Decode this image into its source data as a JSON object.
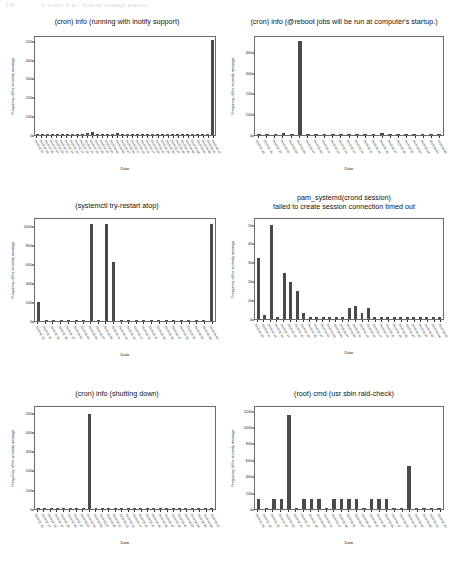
{
  "header": {
    "page_number": "146",
    "running_title": "A. Author et al. / Anomaly message analysis"
  },
  "common": {
    "ylabel": "Frequency of the anomaly message",
    "xlabel": "Date"
  },
  "chart_data": [
    {
      "id": "cron-inotify",
      "type": "bar",
      "title": "(cron) info (running with inotify support)",
      "xlabel": "Date",
      "ylabel": "Frequency of the anomaly message",
      "ylim": [
        0,
        530
      ],
      "yticks": [
        0,
        100,
        200,
        300,
        400,
        500
      ],
      "grid": false,
      "categories": [
        "2019-02-01",
        "2019-02-03",
        "2019-02-05",
        "2019-02-07",
        "2019-02-09",
        "2019-02-11",
        "2019-02-13",
        "2019-02-15",
        "2019-02-17",
        "2019-02-19",
        "2019-02-21",
        "2019-02-23",
        "2019-02-25",
        "2019-02-27",
        "2019-03-01",
        "2019-03-03",
        "2019-03-05",
        "2019-03-07",
        "2019-03-09",
        "2019-03-11",
        "2019-03-13",
        "2019-03-15",
        "2019-03-17",
        "2019-03-19",
        "2019-03-21",
        "2019-03-23",
        "2019-03-25",
        "2019-03-27",
        "2019-03-29",
        "2019-03-31",
        "2019-04-02",
        "2019-04-04",
        "2019-04-06",
        "2019-04-08",
        "2019-04-10",
        "2019-04-12"
      ],
      "values": [
        2,
        2,
        2,
        2,
        2,
        2,
        2,
        2,
        2,
        4,
        9,
        14,
        3,
        3,
        3,
        3,
        12,
        3,
        3,
        2,
        6,
        2,
        2,
        2,
        2,
        2,
        2,
        2,
        2,
        2,
        2,
        2,
        2,
        2,
        2,
        512
      ]
    },
    {
      "id": "cron-reboot",
      "type": "bar",
      "title": "(cron) info (@reboot jobs will be run at computer's startup.)",
      "xlabel": "Date",
      "ylabel": "Frequency of the anomaly message",
      "ylim": [
        0,
        480
      ],
      "yticks": [
        0,
        100,
        200,
        300,
        400
      ],
      "grid": false,
      "categories": [
        "2019-02-23",
        "2019-02-25",
        "2019-02-27",
        "2019-03-01",
        "2019-03-03",
        "2019-03-05",
        "2019-03-07",
        "2019-03-09",
        "2019-03-11",
        "2019-03-13",
        "2019-03-15",
        "2019-03-17",
        "2019-03-19",
        "2019-03-21",
        "2019-03-23",
        "2019-03-25",
        "2019-03-27",
        "2019-03-29",
        "2019-03-31",
        "2019-04-02",
        "2019-04-04",
        "2019-04-06",
        "2019-04-08"
      ],
      "values": [
        2,
        3,
        3,
        8,
        4,
        462,
        6,
        5,
        3,
        2,
        2,
        5,
        4,
        3,
        4,
        8,
        3,
        2,
        3,
        2,
        2,
        2,
        2
      ]
    },
    {
      "id": "systemctl-try-restart-atop",
      "type": "bar",
      "title": "(systemctl try-restart atop)",
      "xlabel": "Date",
      "ylabel": "Frequency of the anomaly message",
      "ylim": [
        0,
        1100
      ],
      "yticks": [
        0,
        200,
        400,
        600,
        800,
        1000
      ],
      "grid": false,
      "categories": [
        "2019-02-19",
        "2019-02-21",
        "2019-02-23",
        "2019-02-25",
        "2019-02-27",
        "2019-03-01",
        "2019-03-03",
        "2019-03-05",
        "2019-03-07",
        "2019-03-09",
        "2019-03-11",
        "2019-03-13",
        "2019-03-15",
        "2019-03-17",
        "2019-03-19",
        "2019-03-21",
        "2019-03-23",
        "2019-03-25",
        "2019-03-27",
        "2019-03-29",
        "2019-03-31",
        "2019-04-02",
        "2019-04-04",
        "2019-04-06"
      ],
      "values": [
        205,
        3,
        3,
        10,
        3,
        3,
        3,
        1050,
        3,
        1050,
        640,
        3,
        3,
        3,
        8,
        3,
        3,
        3,
        3,
        3,
        3,
        8,
        3,
        1050
      ]
    },
    {
      "id": "pam-systemd-crond",
      "type": "bar",
      "title": "pam_systemd(crond session)\nfailed to create session connection timed out",
      "title_line1": "pam_systemd(crond session)",
      "title_line2": "failed to create session connection timed out",
      "xlabel": "Date",
      "ylabel": "Frequency of the anomaly message",
      "ylim": [
        0,
        54
      ],
      "yticks": [
        0,
        10,
        20,
        30,
        40,
        50
      ],
      "grid": false,
      "categories": [
        "2019-02-09",
        "2019-02-11",
        "2019-02-13",
        "2019-02-15",
        "2019-02-17",
        "2019-02-19",
        "2019-02-21",
        "2019-02-23",
        "2019-02-25",
        "2019-02-27",
        "2019-03-01",
        "2019-03-03",
        "2019-03-05",
        "2019-03-07",
        "2019-03-09",
        "2019-03-11",
        "2019-03-13",
        "2019-03-15",
        "2019-03-17",
        "2019-03-19",
        "2019-03-21",
        "2019-03-23",
        "2019-03-25",
        "2019-03-27",
        "2019-03-29",
        "2019-03-31",
        "2019-04-02",
        "2019-04-04",
        "2019-04-06"
      ],
      "values": [
        33,
        2,
        51,
        1,
        25,
        20,
        15,
        3,
        1,
        1,
        1,
        1,
        1,
        1,
        6,
        7,
        3,
        6,
        1,
        1,
        1,
        1,
        1,
        1,
        1,
        1,
        1,
        1,
        1
      ]
    },
    {
      "id": "cron-shutting-down",
      "type": "bar",
      "title": "(cron) info (shutting down)",
      "xlabel": "Date",
      "ylabel": "Frequency of the anomaly message",
      "ylim": [
        0,
        540
      ],
      "yticks": [
        0,
        100,
        200,
        300,
        400,
        500
      ],
      "grid": false,
      "categories": [
        "2019-02-15",
        "2019-02-17",
        "2019-02-19",
        "2019-02-21",
        "2019-02-23",
        "2019-02-25",
        "2019-02-27",
        "2019-03-01",
        "2019-03-03",
        "2019-03-05",
        "2019-03-07",
        "2019-03-09",
        "2019-03-11",
        "2019-03-13",
        "2019-03-15",
        "2019-03-17",
        "2019-03-19",
        "2019-03-21",
        "2019-03-23",
        "2019-03-25",
        "2019-03-27",
        "2019-03-29",
        "2019-03-31",
        "2019-04-02",
        "2019-04-04",
        "2019-04-06",
        "2019-04-08",
        "2019-04-10"
      ],
      "values": [
        3,
        3,
        3,
        8,
        3,
        3,
        3,
        3,
        505,
        3,
        3,
        3,
        3,
        3,
        3,
        3,
        3,
        3,
        3,
        3,
        3,
        3,
        7,
        7,
        3,
        3,
        3,
        3
      ]
    },
    {
      "id": "root-cmd-raid-check",
      "type": "bar",
      "title": "(root) cmd (usr sbin raid-check)",
      "xlabel": "Date",
      "ylabel": "Frequency of the anomaly message",
      "ylim": [
        0,
        1270
      ],
      "yticks": [
        0,
        200,
        400,
        600,
        800,
        1000,
        1200
      ],
      "grid": false,
      "categories": [
        "2019-01-06",
        "2019-01-13",
        "2019-01-20",
        "2019-01-27",
        "2019-02-03",
        "2019-02-10",
        "2019-02-17",
        "2019-02-24",
        "2019-03-03",
        "2019-03-10",
        "2019-03-17",
        "2019-03-24",
        "2019-03-31",
        "2019-04-07",
        "2019-04-14",
        "2019-04-21",
        "2019-04-28",
        "2019-05-05",
        "2019-05-12",
        "2019-05-19",
        "2019-05-26",
        "2019-06-02",
        "2019-06-09",
        "2019-06-16",
        "2019-06-23"
      ],
      "values": [
        125,
        3,
        125,
        125,
        1170,
        3,
        125,
        125,
        125,
        3,
        125,
        125,
        125,
        125,
        3,
        125,
        125,
        125,
        3,
        3,
        540,
        3,
        3,
        3,
        3
      ]
    }
  ]
}
